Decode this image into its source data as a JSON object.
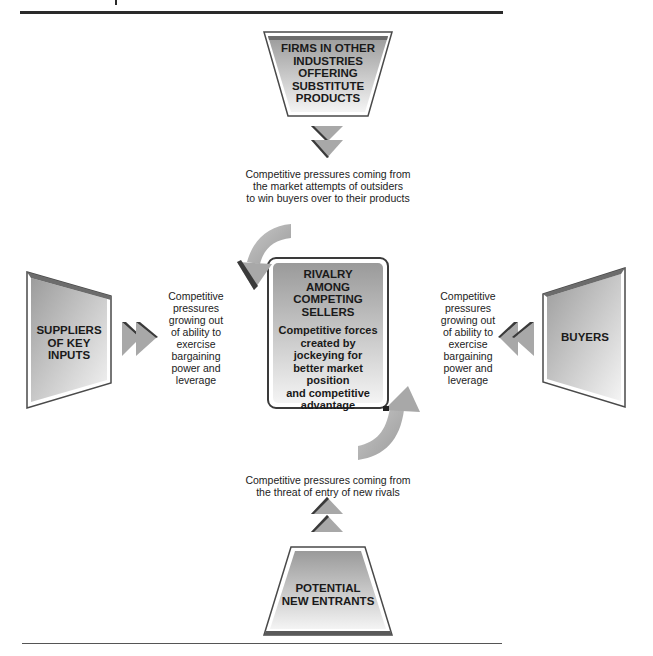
{
  "diagram": {
    "type": "five-forces-model",
    "colors": {
      "box_fill_light": "#f2f2f2",
      "box_fill_dark": "#9a9a9a",
      "box_border": "#4a4a4a",
      "arrow_fill": "#a8a8a8",
      "arrow_shadow": "#3a3a3a",
      "rule": "#2a2a2a"
    },
    "top": {
      "box_label": "FIRMS IN OTHER INDUSTRIES OFFERING SUBSTITUTE PRODUCTS",
      "box_lines": [
        "FIRMS IN OTHER",
        "INDUSTRIES",
        "OFFERING",
        "SUBSTITUTE",
        "PRODUCTS"
      ],
      "note_lines": [
        "Competitive pressures coming from",
        "the market attempts of outsiders",
        "to win buyers over to their products"
      ]
    },
    "left": {
      "box_lines": [
        "SUPPLIERS",
        "OF KEY",
        "INPUTS"
      ],
      "note_lines": [
        "Competitive",
        "pressures",
        "growing out",
        "of ability to",
        "exercise",
        "bargaining",
        "power and",
        "leverage"
      ]
    },
    "right": {
      "box_lines": [
        "BUYERS"
      ],
      "note_lines": [
        "Competitive",
        "pressures",
        "growing out",
        "of ability to",
        "exercise",
        "bargaining",
        "power and",
        "leverage"
      ]
    },
    "bottom": {
      "box_lines": [
        "POTENTIAL",
        "NEW ENTRANTS"
      ],
      "note_lines": [
        "Competitive pressures coming from",
        "the threat of entry of new rivals"
      ]
    },
    "center": {
      "title_lines": [
        "RIVALRY",
        "AMONG",
        "COMPETING",
        "SELLERS"
      ],
      "body_lines": [
        "Competitive forces",
        "created by",
        "jockeying for",
        "better market",
        "position",
        "and competitive",
        "advantage"
      ]
    }
  }
}
